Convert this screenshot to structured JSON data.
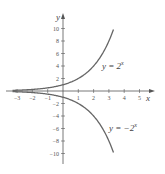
{
  "chart_data": {
    "type": "line",
    "title": "",
    "xlabel": "x",
    "ylabel": "y",
    "xlim": [
      -3.5,
      5.5
    ],
    "ylim": [
      -11,
      11
    ],
    "grid": false,
    "x_ticks": [
      -3,
      -2,
      -1,
      1,
      2,
      3,
      4,
      5
    ],
    "y_ticks": [
      10,
      8,
      6,
      4,
      2,
      -2,
      -4,
      -6,
      -8,
      -10
    ],
    "series": [
      {
        "name": "y = 2^x",
        "function": "2^x",
        "x_range": [
          -3.3,
          3.3
        ],
        "x": [
          -3,
          -2,
          -1,
          0,
          1,
          2,
          3,
          3.3
        ],
        "y": [
          0.125,
          0.25,
          0.5,
          1,
          2,
          4,
          8,
          9.85
        ]
      },
      {
        "name": "y = -2^x",
        "function": "-2^x",
        "x_range": [
          -3.3,
          3.3
        ],
        "x": [
          -3,
          -2,
          -1,
          0,
          1,
          2,
          3,
          3.3
        ],
        "y": [
          -0.125,
          -0.25,
          -0.5,
          -1,
          -2,
          -4,
          -8,
          -9.85
        ]
      }
    ],
    "annotations": [
      {
        "text": "y = 2^x",
        "near": [
          3.5,
          4
        ]
      },
      {
        "text": "y = -2^x",
        "near": [
          4.5,
          -6
        ]
      }
    ]
  },
  "labels": {
    "x_axis": "x",
    "y_axis": "y",
    "curve1_base": "y = 2",
    "curve1_exp": "x",
    "curve2_base": "y = −2",
    "curve2_exp": "x"
  }
}
